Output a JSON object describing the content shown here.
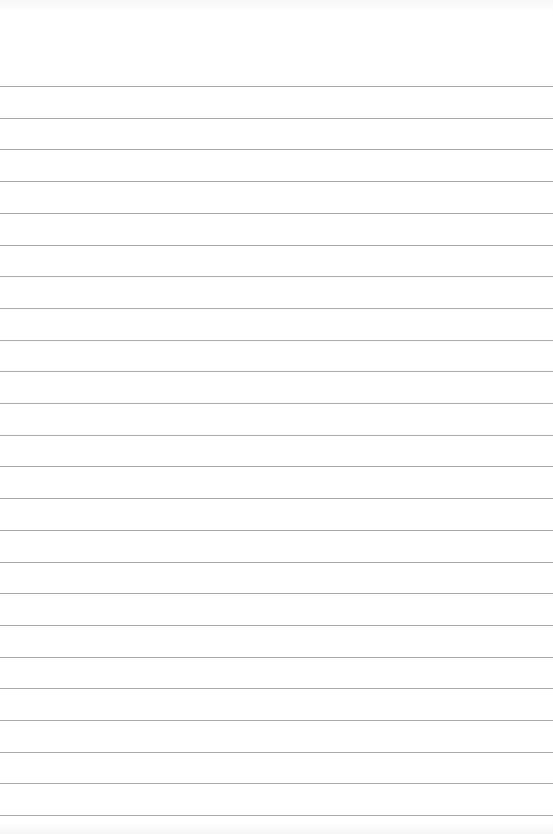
{
  "paper": {
    "type": "ruled",
    "background_color": "#ffffff",
    "rule_color": "#9a9a9a",
    "rule_count": 24,
    "first_rule_y": 86,
    "rule_spacing": 31.7
  }
}
